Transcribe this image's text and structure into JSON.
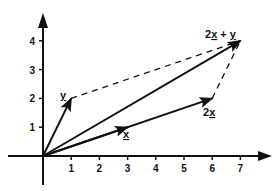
{
  "diagram": {
    "x_axis": {
      "ticks": [
        "1",
        "2",
        "3",
        "4",
        "5",
        "6",
        "7"
      ],
      "range": [
        0,
        7.8
      ]
    },
    "y_axis": {
      "ticks": [
        "1",
        "2",
        "3",
        "4"
      ],
      "range": [
        0,
        4.6
      ]
    },
    "vectors": [
      {
        "name": "y",
        "label": "y",
        "to": [
          1,
          2
        ],
        "arrow_at": 1.0
      },
      {
        "name": "x",
        "label": "x",
        "to": [
          3,
          1
        ],
        "arrow_at": 1.0
      },
      {
        "name": "2x",
        "label": "2x",
        "to": [
          6,
          2
        ],
        "arrow_at": 1.0
      },
      {
        "name": "2x-plus-y",
        "label": "2x + y",
        "to": [
          7,
          4
        ],
        "arrow_at": 1.0
      }
    ],
    "dashed_lines": [
      {
        "name": "y-to-sum",
        "from": [
          1,
          2
        ],
        "to": [
          7,
          4
        ]
      },
      {
        "name": "2x-to-sum",
        "from": [
          6,
          2
        ],
        "to": [
          7,
          4
        ]
      }
    ],
    "labels": {
      "y": "y",
      "x": "x",
      "two_x_num": "2",
      "two_x_var": "x",
      "sum_num": "2",
      "sum_x": "x",
      "sum_plus": " + ",
      "sum_y": "y"
    },
    "colors": {
      "ink": "#111111",
      "background": "#ffffff"
    }
  }
}
